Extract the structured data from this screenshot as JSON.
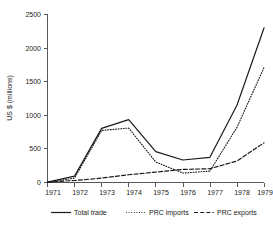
{
  "chart_data": {
    "type": "line",
    "title": "",
    "xlabel": "",
    "ylabel": "US $ (millions)",
    "categories": [
      "1971",
      "1972",
      "1973",
      "1974",
      "1975",
      "1976",
      "1977",
      "1978",
      "1979"
    ],
    "x": [
      1971,
      1972,
      1973,
      1974,
      1975,
      1976,
      1977,
      1978,
      1979
    ],
    "xlim": [
      1971,
      1979
    ],
    "ylim": [
      0,
      2500
    ],
    "yticks": [
      0,
      500,
      1000,
      1500,
      2000,
      2500
    ],
    "ytick_labels": [
      "0",
      "500",
      "1000",
      "1500",
      "2000",
      "2500"
    ],
    "grid": false,
    "legend_position": "bottom",
    "series": [
      {
        "name": "Total trade",
        "style": "solid",
        "values": [
          5,
          95,
          805,
          935,
          460,
          335,
          375,
          1150,
          2300
        ]
      },
      {
        "name": "PRC imports",
        "style": "dotted",
        "values": [
          0,
          65,
          775,
          810,
          305,
          140,
          170,
          820,
          1710
        ]
      },
      {
        "name": "PRC exports",
        "style": "dashed",
        "values": [
          5,
          30,
          65,
          115,
          155,
          195,
          205,
          320,
          590
        ]
      }
    ]
  },
  "legend": {
    "items": [
      {
        "label": "Total trade"
      },
      {
        "label": "PRC imports"
      },
      {
        "label": "PRC exports"
      }
    ]
  },
  "colors": {
    "line": "#1a1a1a",
    "axis": "#58585a",
    "background": "#ffffff"
  }
}
